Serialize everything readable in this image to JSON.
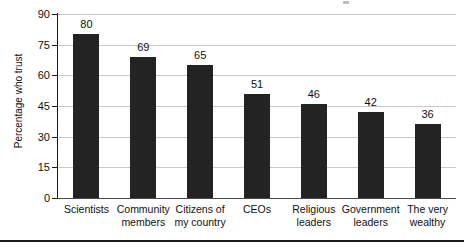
{
  "chart_data": {
    "type": "bar",
    "title": "",
    "subtitle": "",
    "xlabel": "",
    "ylabel": "Percentage who trust",
    "ylim": [
      0,
      90
    ],
    "yticks": [
      0,
      15,
      30,
      45,
      60,
      75,
      90
    ],
    "ytick_labels": [
      "0",
      "15",
      "30",
      "45",
      "60",
      "75",
      "90"
    ],
    "grid": "horizontal",
    "legend": "none",
    "bar_color": "#232323",
    "gridline_color": "#c8c8c8",
    "axis_color": "#1a1a1a",
    "categories": [
      "Scientists",
      "Community members",
      "Citizens of my country",
      "CEOs",
      "Religious leaders",
      "Government leaders",
      "The very wealthy"
    ],
    "category_lines": [
      [
        "Scientists"
      ],
      [
        "Community",
        "members"
      ],
      [
        "Citizens of",
        "my country"
      ],
      [
        "CEOs"
      ],
      [
        "Religious",
        "leaders"
      ],
      [
        "Government",
        "leaders"
      ],
      [
        "The very",
        "wealthy"
      ]
    ],
    "values": [
      80,
      69,
      65,
      51,
      46,
      42,
      36
    ],
    "value_labels": [
      "80",
      "69",
      "65",
      "51",
      "46",
      "42",
      "36"
    ]
  }
}
